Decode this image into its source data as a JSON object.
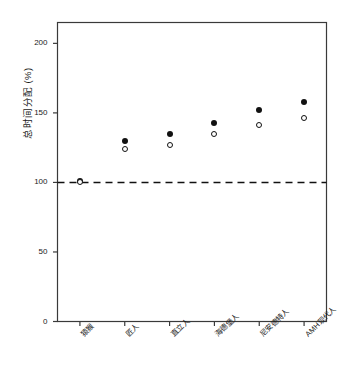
{
  "chart_data": {
    "type": "scatter",
    "title": "",
    "xlabel": "",
    "ylabel": "总时间分配 (%)",
    "categories": [
      "猿猴",
      "匠人",
      "直立人",
      "海德堡人",
      "尼安德特人",
      "AMH现代人"
    ],
    "series": [
      {
        "name": "filled",
        "marker": "filled-circle",
        "color": "#111111",
        "values": [
          101,
          130,
          135,
          143,
          152,
          158
        ]
      },
      {
        "name": "open",
        "marker": "open-circle",
        "color": "#111111",
        "values": [
          100,
          124,
          127,
          135,
          141,
          146
        ]
      }
    ],
    "ylim": [
      0,
      215
    ],
    "yticks": [
      0,
      50,
      100,
      150,
      200
    ],
    "ytick_labels": [
      "0",
      "50",
      "100",
      "150",
      "200"
    ],
    "grid": false,
    "legend": "none",
    "reference_line": {
      "name": "baseline-100",
      "value": 100,
      "style": "dashed",
      "color": "#111111"
    },
    "axis_color": "#3a3a3a",
    "background": "#ffffff"
  }
}
